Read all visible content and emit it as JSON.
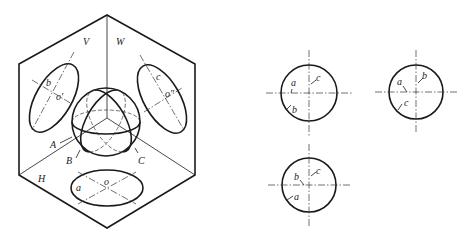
{
  "figure": {
    "isometric": {
      "planes": {
        "V": "V",
        "W": "W",
        "H": "H"
      },
      "projection_labels": {
        "v_b": "b",
        "v_o": "o'",
        "w_c": "c",
        "w_o": "o\"",
        "h_a": "a",
        "h_o": "o"
      },
      "sphere_labels": {
        "A": "A",
        "B": "B",
        "C": "C"
      }
    },
    "views": [
      {
        "name": "front-view",
        "labels": {
          "l1": "a",
          "l2": "c",
          "l3": "b"
        }
      },
      {
        "name": "side-view",
        "labels": {
          "l1": "a",
          "l2": "b",
          "l3": "c"
        }
      },
      {
        "name": "top-view",
        "labels": {
          "l1": "b",
          "l2": "c",
          "l3": "a"
        }
      }
    ]
  }
}
